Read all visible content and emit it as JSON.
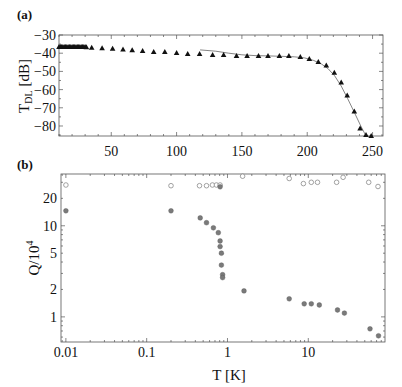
{
  "figure": {
    "panels": [
      {
        "label": "(a)"
      },
      {
        "label": "(b)"
      }
    ]
  },
  "chart_data": [
    {
      "panel": "(a)",
      "type": "scatter",
      "title": "",
      "xlabel": "",
      "ylabel": "T_DL [dB]",
      "ylabel_main": "T",
      "ylabel_sub": "DL",
      "ylabel_unit": " [dB]",
      "xlim": [
        10,
        258
      ],
      "ylim": [
        -85.5,
        -30
      ],
      "xticks": [
        50,
        100,
        150,
        200,
        250
      ],
      "yticks": [
        -30,
        -40,
        -50,
        -60,
        -70,
        -80
      ],
      "grid": false,
      "marker": "triangle",
      "series": [
        {
          "name": "measured",
          "x": [
            10,
            11,
            12,
            13,
            14,
            15,
            16,
            17,
            18,
            19,
            20,
            21,
            22,
            23,
            24,
            25,
            26,
            27,
            28,
            29,
            30,
            31,
            35,
            43,
            51,
            59,
            66,
            74,
            82.5,
            91,
            100,
            108.5,
            117.6,
            127.6,
            136,
            145.9,
            154,
            162.7,
            170,
            178.7,
            186,
            194.7,
            201.6,
            208.5,
            214.6,
            220.7,
            226,
            230.6,
            236,
            240.5,
            245,
            249
          ],
          "y": [
            -36.6,
            -36.6,
            -36.6,
            -36.6,
            -36.6,
            -36.6,
            -36.6,
            -36.6,
            -36.6,
            -36.6,
            -36.6,
            -36.6,
            -36.6,
            -36.6,
            -36.6,
            -36.6,
            -36.6,
            -36.6,
            -36.6,
            -36.6,
            -36.6,
            -36.7,
            -37.0,
            -37.3,
            -37.6,
            -38.0,
            -38.4,
            -38.8,
            -39.3,
            -39.3,
            -39.9,
            -40.4,
            -40.4,
            -41.0,
            -41.0,
            -41.5,
            -41.5,
            -41.5,
            -41.5,
            -41.5,
            -41.5,
            -42.1,
            -43.2,
            -44.8,
            -46.8,
            -50.7,
            -56.1,
            -63.2,
            -72.0,
            -81.3,
            -85.0,
            -85.5
          ]
        },
        {
          "name": "fit",
          "style": "line",
          "x": [
            118,
            130,
            140,
            150,
            160,
            170,
            180,
            190,
            198,
            205,
            211,
            216,
            221,
            226,
            231,
            236,
            241,
            245
          ],
          "y": [
            -38.2,
            -38.9,
            -40.0,
            -40.9,
            -41.3,
            -41.5,
            -41.7,
            -42.0,
            -42.6,
            -44.0,
            -46.0,
            -48.5,
            -52.5,
            -58.0,
            -65.0,
            -72.5,
            -80.0,
            -85.5
          ]
        }
      ]
    },
    {
      "panel": "(b)",
      "type": "scatter",
      "title": "",
      "xlabel": "T [K]",
      "ylabel": "Q/10^4",
      "ylabel_main": "Q/10",
      "ylabel_sup": "4",
      "xscale": "log",
      "yscale": "log",
      "xlim": [
        0.0087,
        89
      ],
      "ylim": [
        0.53,
        37
      ],
      "xticks": [
        0.01,
        0.1,
        1,
        10
      ],
      "xtick_labels": [
        "0.01",
        "0.1",
        "1",
        "10"
      ],
      "yticks": [
        1,
        2,
        5,
        10,
        20
      ],
      "ytick_labels": [
        "1",
        "2",
        "5",
        "10",
        "20"
      ],
      "grid": false,
      "series": [
        {
          "name": "open circles",
          "marker": "open-circle",
          "color": "#8a8a8a",
          "x": [
            0.01,
            0.2,
            0.45,
            0.55,
            0.65,
            0.73,
            0.81,
            1.54,
            5.8,
            8.7,
            10.9,
            13,
            22.4,
            27,
            56,
            73
          ],
          "y": [
            28,
            27.5,
            27.5,
            27.5,
            28,
            28,
            28,
            35,
            33,
            29,
            30,
            30,
            30,
            34,
            30,
            27
          ]
        },
        {
          "name": "filled circles",
          "marker": "filled-circle",
          "color": "#7a7a7a",
          "x": [
            0.01,
            0.2,
            0.46,
            0.55,
            0.67,
            0.77,
            0.81,
            0.81,
            0.84,
            0.84,
            0.87,
            0.87,
            0.81,
            1.6,
            5.8,
            8.9,
            10.9,
            13.7,
            23,
            28,
            58,
            74
          ],
          "y": [
            14.6,
            14.6,
            12.2,
            10.8,
            9.5,
            8.4,
            6.8,
            5.9,
            5.0,
            3.7,
            2.9,
            2.7,
            26.8,
            1.93,
            1.58,
            1.39,
            1.39,
            1.35,
            1.19,
            1.1,
            0.74,
            0.62
          ]
        }
      ]
    }
  ]
}
